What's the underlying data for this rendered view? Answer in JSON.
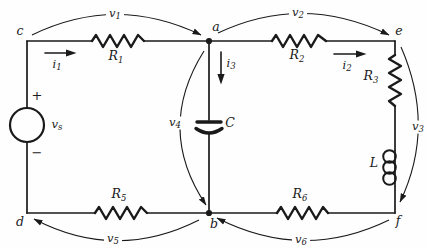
{
  "figure": {
    "type": "circuit-diagram",
    "ink": "#1a1a1a",
    "background": "#fefefe"
  },
  "nodes": {
    "c": "c",
    "a": "a",
    "e": "e",
    "d": "d",
    "b": "b",
    "f": "f"
  },
  "components": {
    "r1": {
      "base": "R",
      "sub": "1"
    },
    "r2": {
      "base": "R",
      "sub": "2"
    },
    "r3": {
      "base": "R",
      "sub": "3"
    },
    "r5": {
      "base": "R",
      "sub": "5"
    },
    "r6": {
      "base": "R",
      "sub": "6"
    },
    "capacitor": {
      "base": "C",
      "sub": ""
    },
    "inductor": {
      "base": "L",
      "sub": ""
    },
    "source": {
      "base": "v",
      "sub": "s",
      "plus": "+",
      "minus": "−"
    }
  },
  "voltages": {
    "v1": {
      "base": "v",
      "sub": "1"
    },
    "v2": {
      "base": "v",
      "sub": "2"
    },
    "v3": {
      "base": "v",
      "sub": "3"
    },
    "v4": {
      "base": "v",
      "sub": "4"
    },
    "v5": {
      "base": "v",
      "sub": "5"
    },
    "v6": {
      "base": "v",
      "sub": "6"
    }
  },
  "currents": {
    "i1": {
      "base": "i",
      "sub": "1"
    },
    "i2": {
      "base": "i",
      "sub": "2"
    },
    "i3": {
      "base": "i",
      "sub": "3"
    }
  }
}
